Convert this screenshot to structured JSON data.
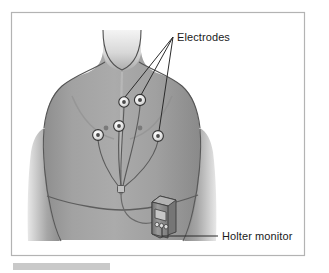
{
  "figure": {
    "background_color": "#ffffff",
    "frame": {
      "name": "figure-border",
      "color": "#b0b0b0",
      "x": 11,
      "y": 12,
      "width": 294,
      "height": 244
    },
    "caption_bar": {
      "name": "caption-bar",
      "color": "#c9c9c9",
      "x": 13,
      "y": 263,
      "width": 97,
      "height": 7
    }
  },
  "labels": [
    {
      "id": "electrodes",
      "text": "Electrodes",
      "x": 177,
      "y": 38,
      "anchor": "start",
      "leader_origin": {
        "x": 173,
        "y": 37
      }
    },
    {
      "id": "holter-monitor",
      "text": "Holter monitor",
      "x": 222,
      "y": 240,
      "anchor": "start",
      "leader_origin": {
        "x": 162,
        "y": 236
      }
    }
  ],
  "body": {
    "skin_color": "#9d9d9d",
    "skin_highlight": "#cfcfcf",
    "outline_color": "#5a5a5a",
    "belt_color": "#6f6f6f"
  },
  "electrodes": {
    "count": 5,
    "ring_outer_color": "#f2f2f2",
    "ring_edge_color": "#3a3a3a",
    "center_color": "#4a4a4a",
    "positions": [
      {
        "id": "electrode-upper-right",
        "x": 124,
        "y": 102,
        "r": 5.2
      },
      {
        "id": "electrode-upper-left",
        "x": 140,
        "y": 100,
        "r": 5.6
      },
      {
        "id": "electrode-mid-center",
        "x": 119,
        "y": 126,
        "r": 5.4
      },
      {
        "id": "electrode-lower-right",
        "x": 98,
        "y": 135,
        "r": 5.4
      },
      {
        "id": "electrode-lower-left",
        "x": 158,
        "y": 136,
        "r": 5.4
      }
    ]
  },
  "nipples": {
    "color": "#7a7a7a",
    "positions": [
      {
        "id": "nipple-right",
        "x": 106,
        "y": 128,
        "r": 2.4
      },
      {
        "id": "nipple-left",
        "x": 140,
        "y": 128,
        "r": 2.4
      }
    ]
  },
  "wires": {
    "color": "#575757",
    "junction": {
      "id": "cable-junction",
      "x": 120,
      "y": 188,
      "w": 6,
      "h": 7
    }
  },
  "monitor": {
    "name": "holter-monitor-device",
    "body_color": "#8f8f8f",
    "body_dark": "#6e6e6e",
    "body_light": "#b5b5b5",
    "outline_color": "#3d3d3d",
    "screen_color": "#bdbdbd",
    "screen_outline": "#4a4a4a",
    "button_color": "#d6d6d6",
    "button_outline": "#3f3f3f",
    "button_count": 3,
    "x": 152,
    "y": 196,
    "width": 24,
    "height": 40
  }
}
